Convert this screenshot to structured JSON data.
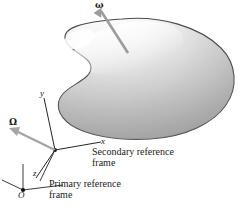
{
  "figure": {
    "background": "#ffffff",
    "outline_color": "#4a4a4a",
    "arrow_color": "#9a9a9a",
    "axis_color": "#2b2b2b",
    "body_fill_light": "#ffffff",
    "body_fill_dark": "#9b9b9b"
  },
  "vectors": [
    {
      "name": "omega",
      "label": "ω",
      "description": "angular-velocity vector of body",
      "color": "#9a9a9a"
    },
    {
      "name": "Omega",
      "label": "Ω",
      "description": "angular-velocity vector of secondary frame",
      "color": "#9a9a9a"
    }
  ],
  "secondary_frame": {
    "axes": [
      {
        "name": "x",
        "label": "x"
      },
      {
        "name": "y",
        "label": "y"
      }
    ],
    "caption_line1": "Secondary reference",
    "caption_line2": "frame"
  },
  "primary_frame": {
    "axes": [
      {
        "name": "z",
        "label": "z"
      }
    ],
    "origin_label": "O",
    "caption_line1": "Primary reference",
    "caption_line2": "frame"
  }
}
